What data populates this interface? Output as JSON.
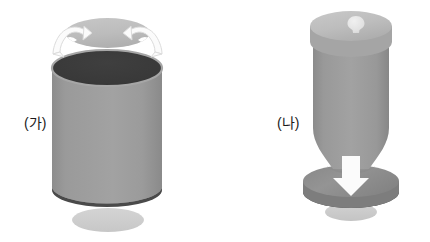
{
  "image": {
    "kind": "technical-illustration",
    "background_color": "#ffffff",
    "width": 430,
    "height": 242,
    "description": "Two shaded 3D cylindrical container diagrams labelled in Korean"
  },
  "palette": {
    "body_gray": "#9a9a9a",
    "body_gray_dark": "#8e8e8e",
    "lid_top_light": "#bdbdbd",
    "lid_top_light_2": "#b4b4b4",
    "interior_dark": "#3a3a3a",
    "interior_dark_2": "#333333",
    "rim_edge_dark": "#4d4d4d",
    "shadow_ellipse": "#cfcfcf",
    "arrow_white": "#fbfbfb",
    "arrow_outline": "#d9d9d9",
    "knob_light": "#e3e3e3",
    "label_text": "#1b1b1b"
  },
  "figures": [
    {
      "id": "ga",
      "label": "(가)",
      "state": "open",
      "parts": [
        {
          "name": "lid",
          "shape": "ellipse-disc",
          "color": "#bdbdbd",
          "detached": true
        },
        {
          "name": "rotation-arrow-left",
          "shape": "curved-arrow",
          "color": "#fbfbfb",
          "direction": "counter-clockwise-out"
        },
        {
          "name": "rotation-arrow-right",
          "shape": "curved-arrow",
          "color": "#fbfbfb",
          "direction": "clockwise-out"
        },
        {
          "name": "container-opening",
          "shape": "ellipse",
          "color": "#3a3a3a"
        },
        {
          "name": "container-body",
          "shape": "cylinder",
          "color": "#9a9a9a"
        },
        {
          "name": "container-bottom-rim",
          "shape": "ellipse-edge",
          "color": "#4d4d4d"
        },
        {
          "name": "ground-shadow",
          "shape": "ellipse",
          "color": "#cfcfcf"
        }
      ]
    },
    {
      "id": "na",
      "label": "(나)",
      "state": "closed",
      "parts": [
        {
          "name": "lid-knob",
          "shape": "bulb",
          "color": "#e3e3e3"
        },
        {
          "name": "lid-top",
          "shape": "ellipse-disc",
          "color": "#bdbdbd",
          "detached": false
        },
        {
          "name": "container-body",
          "shape": "cylinder",
          "color": "#9a9a9a"
        },
        {
          "name": "base-disc",
          "shape": "ellipse-disc",
          "color": "#8e8e8e"
        },
        {
          "name": "base-rim",
          "shape": "ellipse-edge",
          "color": "#4d4d4d"
        },
        {
          "name": "down-arrow",
          "shape": "block-arrow",
          "color": "#fbfbfb",
          "direction": "down"
        },
        {
          "name": "ground-shadow",
          "shape": "ellipse",
          "color": "#cfcfcf"
        }
      ]
    }
  ]
}
